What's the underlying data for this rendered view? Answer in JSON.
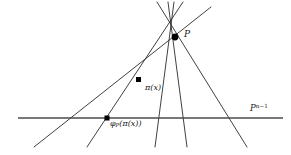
{
  "figure": {
    "type": "geometry-diagram",
    "background_color": "#ffffff",
    "line_color": "#2b2b2b",
    "hyperplane_color": "#4a4a4a",
    "point_color": "#000000",
    "labels": {
      "apex": "P",
      "mid_point": "π(x)",
      "projected_point_fn": "φ",
      "projected_point_sub": "P",
      "projected_point_arg": "(π(x))",
      "hyperplane_base": "P",
      "hyperplane_exp": "n−1"
    },
    "geometry": {
      "apex": {
        "x": 175,
        "y": 37,
        "label_dx": 9,
        "label_dy": -7
      },
      "hyperplane": {
        "y": 118,
        "x_start": 18,
        "x_end": 283
      },
      "marked_points": [
        {
          "name": "pi-x",
          "x": 139,
          "y": 80
        },
        {
          "name": "phi-p-pi-x",
          "x": 107,
          "y": 118
        }
      ],
      "rays": [
        {
          "name": "ray-far-left",
          "top_x": 211,
          "top_y": 7,
          "bottom_x": 34,
          "bottom_y": 147,
          "cross_x": 70
        },
        {
          "name": "ray-left",
          "top_x": 183,
          "top_y": 2,
          "bottom_x": 87,
          "bottom_y": 147,
          "cross_x": 107
        },
        {
          "name": "ray-center-left",
          "top_x": 174,
          "top_y": 2,
          "bottom_x": 155,
          "bottom_y": 147,
          "cross_x": 158
        },
        {
          "name": "ray-center-right",
          "top_x": 168,
          "top_y": 2,
          "bottom_x": 187,
          "bottom_y": 147,
          "cross_x": 182
        },
        {
          "name": "ray-right",
          "top_x": 157,
          "top_y": 2,
          "bottom_x": 247,
          "bottom_y": 147,
          "cross_x": 225
        }
      ]
    }
  }
}
